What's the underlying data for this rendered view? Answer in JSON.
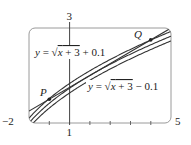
{
  "diagram": {
    "type": "function-graph",
    "window": {
      "xmin": -2,
      "xmax": 5,
      "ymin": 1,
      "ymax": 3
    },
    "axis_labels": {
      "x_left": "−2",
      "x_right": "5",
      "y_top": "3",
      "y_bottom": "1"
    },
    "curves": [
      {
        "id": "upper",
        "label": "y = √x + 3 + 0.1",
        "label_parts": {
          "lhs": "y = ",
          "radicand": "x + 3",
          "rhs": " + 0.1"
        },
        "offset": 0.1
      },
      {
        "id": "middle",
        "label": "y = √x + 3",
        "offset": 0
      },
      {
        "id": "lower",
        "label": "y = √x + 3 − 0.1",
        "label_parts": {
          "lhs": "y = ",
          "radicand": "x + 3",
          "rhs": " − 0.1"
        },
        "offset": -0.1
      }
    ],
    "line": {
      "label": "tangent line",
      "slope": 0.25,
      "through": [
        1,
        2
      ]
    },
    "points": [
      {
        "name": "P",
        "x": -1,
        "y": 1.5
      },
      {
        "name": "Q",
        "x": 4,
        "y": 2.75
      }
    ],
    "colors": {
      "curve": "#333333",
      "frame": "#9a9a9a",
      "axis": "#444444",
      "text": "#222222"
    }
  }
}
